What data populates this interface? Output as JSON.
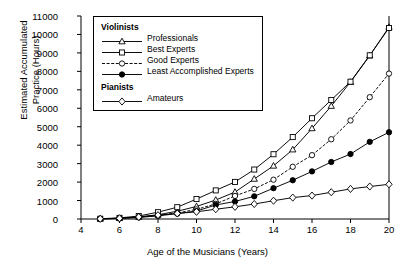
{
  "chart_data": {
    "type": "line",
    "title": "",
    "xlabel": "Age of the Musicians (Years)",
    "ylabel": "Estimated Accumulated\nPractice (Hours)",
    "xlim": [
      4,
      20
    ],
    "ylim": [
      0,
      11000
    ],
    "xticks": [
      4,
      6,
      8,
      10,
      12,
      14,
      16,
      18,
      20
    ],
    "yticks": [
      0,
      1000,
      2000,
      3000,
      4000,
      5000,
      6000,
      7000,
      8000,
      9000,
      10000,
      11000
    ],
    "grid": false,
    "legend_position": "upper-left-inset",
    "x": [
      5,
      6,
      7,
      8,
      9,
      10,
      11,
      12,
      13,
      14,
      15,
      16,
      17,
      18,
      19,
      20
    ],
    "series": [
      {
        "name": "Professionals",
        "group": "Violinists",
        "marker": "triangle-open",
        "linestyle": "solid",
        "values": [
          10,
          40,
          110,
          230,
          420,
          680,
          1030,
          1460,
          2170,
          2880,
          3760,
          4910,
          6120,
          7420,
          8850,
          10400
        ]
      },
      {
        "name": "Best Experts",
        "group": "Violinists",
        "marker": "square-open",
        "linestyle": "solid",
        "values": [
          15,
          60,
          160,
          370,
          640,
          1080,
          1550,
          2010,
          2680,
          3510,
          4440,
          5460,
          6450,
          7440,
          8870,
          10350
        ]
      },
      {
        "name": "Good Experts",
        "group": "Violinists",
        "marker": "circle-open",
        "linestyle": "dashed",
        "values": [
          10,
          35,
          95,
          190,
          330,
          520,
          820,
          1250,
          1630,
          2130,
          2830,
          3460,
          4320,
          5340,
          6600,
          7880
        ]
      },
      {
        "name": "Least Accomplished Experts",
        "group": "Violinists",
        "marker": "circle-filled",
        "linestyle": "solid",
        "values": [
          10,
          30,
          85,
          170,
          290,
          430,
          760,
          950,
          1230,
          1670,
          2100,
          2580,
          3090,
          3520,
          4180,
          4700
        ]
      },
      {
        "name": "Amateurs",
        "group": "Pianists",
        "marker": "diamond-open",
        "linestyle": "solid",
        "values": [
          10,
          40,
          110,
          210,
          300,
          390,
          530,
          660,
          810,
          990,
          1160,
          1270,
          1450,
          1630,
          1760,
          1880
        ]
      }
    ]
  },
  "legend": {
    "groups": [
      {
        "header": "Violinists",
        "entries": [
          {
            "label": "Professionals",
            "marker": "triangle-open",
            "linestyle": "solid"
          },
          {
            "label": "Best Experts",
            "marker": "square-open",
            "linestyle": "solid"
          },
          {
            "label": "Good Experts",
            "marker": "circle-open",
            "linestyle": "dashed"
          },
          {
            "label": "Least Accomplished Experts",
            "marker": "circle-filled",
            "linestyle": "solid"
          }
        ]
      },
      {
        "header": "Pianists",
        "entries": [
          {
            "label": "Amateurs",
            "marker": "diamond-open",
            "linestyle": "solid"
          }
        ]
      }
    ]
  },
  "colors": {
    "line": "#000000",
    "axis": "#000000",
    "background": "#ffffff",
    "marker_fill_open": "#ffffff",
    "marker_fill_closed": "#000000"
  }
}
